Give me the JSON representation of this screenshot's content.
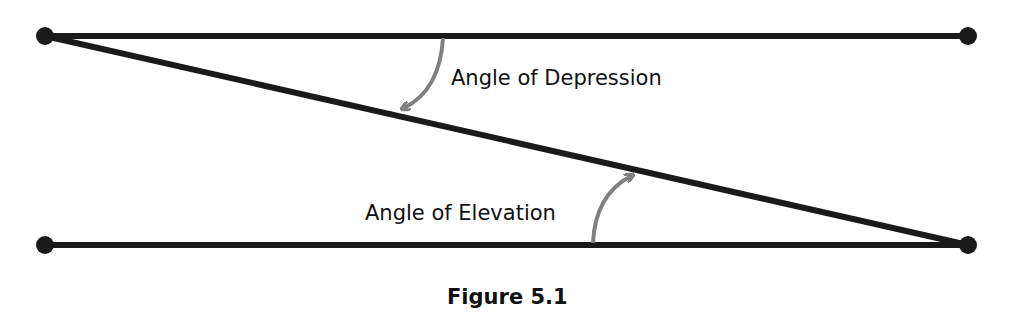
{
  "figure": {
    "caption": "Figure 5.1",
    "labels": {
      "depression": "Angle of Depression",
      "elevation": "Angle of Elevation"
    },
    "colors": {
      "line": "#1a1a1a",
      "arrow": "#808080",
      "text": "#111111"
    },
    "points": {
      "top_left": [
        45,
        36
      ],
      "top_right": [
        968,
        36
      ],
      "bottom_left": [
        45,
        245
      ],
      "bottom_right": [
        968,
        245
      ]
    },
    "lines": [
      {
        "name": "top-horizontal",
        "from": "top_left",
        "to": "top_right"
      },
      {
        "name": "bottom-horizontal",
        "from": "bottom_left",
        "to": "bottom_right"
      },
      {
        "name": "line-of-sight",
        "from": "top_left",
        "to": "bottom_right"
      }
    ]
  }
}
